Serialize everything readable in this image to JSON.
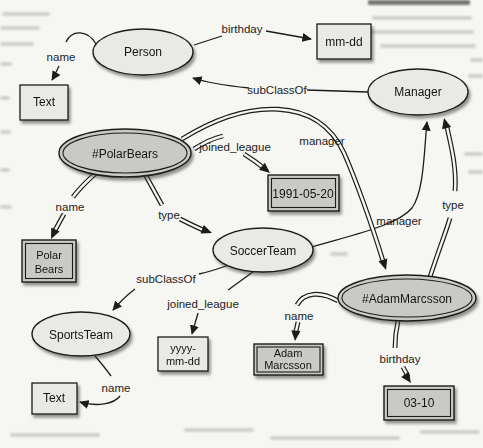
{
  "graph": {
    "kind": "rdf-ontology-diagram",
    "colors": {
      "paper": "#f6f6f3",
      "class_fill": "#e9e9e6",
      "instance_fill": "#c9c9c5",
      "stroke": "#1c1c1c"
    },
    "nodes": {
      "person": {
        "label": "Person",
        "shape": "ellipse",
        "kind": "class"
      },
      "manager": {
        "label": "Manager",
        "shape": "ellipse",
        "kind": "class"
      },
      "polar_bears": {
        "label": "#PolarBears",
        "shape": "ellipse",
        "kind": "instance"
      },
      "soccer_team": {
        "label": "SoccerTeam",
        "shape": "ellipse",
        "kind": "class"
      },
      "sports_team": {
        "label": "SportsTeam",
        "shape": "ellipse",
        "kind": "class"
      },
      "adam_marcsson": {
        "label": "#AdamMarcsson",
        "shape": "ellipse",
        "kind": "instance"
      },
      "text_top": {
        "label": "Text",
        "shape": "rect",
        "kind": "class"
      },
      "mm_dd": {
        "label": "mm-dd",
        "shape": "rect",
        "kind": "class"
      },
      "date_1991_05_20": {
        "label": "1991-05-20",
        "shape": "rect",
        "kind": "instance"
      },
      "polar_bears_name": {
        "lines": [
          "Polar",
          "Bears"
        ],
        "shape": "rect",
        "kind": "instance"
      },
      "yyyy_mm_dd": {
        "lines": [
          "yyyy-",
          "mm-dd"
        ],
        "shape": "rect",
        "kind": "class"
      },
      "adam_marcsson_name": {
        "lines": [
          "Adam",
          "Marcsson"
        ],
        "shape": "rect",
        "kind": "instance"
      },
      "date_03_10": {
        "label": "03-10",
        "shape": "rect",
        "kind": "instance"
      },
      "text_bottom": {
        "label": "Text",
        "shape": "rect",
        "kind": "class"
      }
    },
    "edges": [
      {
        "from": "Person",
        "to": "Text",
        "label": "name",
        "style": "single"
      },
      {
        "from": "Person",
        "to": "mm-dd",
        "label": "birthday",
        "style": "single"
      },
      {
        "from": "Manager",
        "to": "Person",
        "label": "subClassOf",
        "style": "single"
      },
      {
        "from": "#PolarBears",
        "to": "1991-05-20",
        "label": "joined_league",
        "style": "double"
      },
      {
        "from": "#PolarBears",
        "to": "#AdamMarcsson",
        "label": "manager",
        "style": "double"
      },
      {
        "from": "#PolarBears",
        "to": "Polar Bears",
        "label": "name",
        "style": "double"
      },
      {
        "from": "#PolarBears",
        "to": "SoccerTeam",
        "label": "type",
        "style": "double"
      },
      {
        "from": "SoccerTeam",
        "to": "Manager",
        "label": "manager",
        "style": "single"
      },
      {
        "from": "#AdamMarcsson",
        "to": "Manager",
        "label": "type",
        "style": "double"
      },
      {
        "from": "SoccerTeam",
        "to": "SportsTeam",
        "label": "subClassOf",
        "style": "single"
      },
      {
        "from": "SoccerTeam",
        "to": "yyyy-mm-dd",
        "label": "joined_league",
        "style": "single"
      },
      {
        "from": "SportsTeam",
        "to": "Text",
        "label": "name",
        "style": "single"
      },
      {
        "from": "#AdamMarcsson",
        "to": "Adam Marcsson",
        "label": "name",
        "style": "double"
      },
      {
        "from": "#AdamMarcsson",
        "to": "03-10",
        "label": "birthday",
        "style": "double"
      }
    ]
  }
}
